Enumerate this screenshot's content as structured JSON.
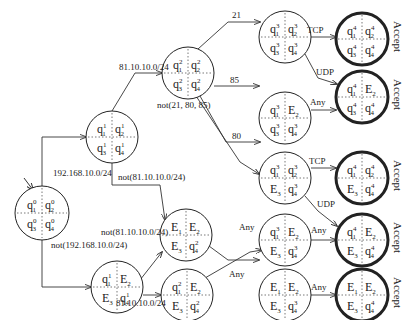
{
  "diagram": {
    "type": "state-machine",
    "nodes": [
      {
        "id": "S0",
        "x": 42,
        "y": 213,
        "r": 27,
        "cells": [
          [
            "q",
            "1",
            "0"
          ],
          [
            "q",
            "2",
            "0"
          ],
          [
            "q",
            "3",
            "0"
          ],
          [
            "q",
            "4",
            "0"
          ]
        ],
        "start": true,
        "accept": false
      },
      {
        "id": "A",
        "x": 112,
        "y": 137,
        "r": 26,
        "cells": [
          [
            "q",
            "1",
            "1"
          ],
          [
            "q",
            "2",
            "1"
          ],
          [
            "q",
            "3",
            "1"
          ],
          [
            "q",
            "4",
            "1"
          ]
        ],
        "accept": false
      },
      {
        "id": "B",
        "x": 117,
        "y": 287,
        "r": 26,
        "cells": [
          [
            "q",
            "1",
            "1"
          ],
          [
            "E",
            "2",
            ""
          ],
          [
            "E",
            "3",
            ""
          ],
          [
            "q",
            "4",
            "1"
          ]
        ],
        "accept": false
      },
      {
        "id": "C",
        "x": 188,
        "y": 73,
        "r": 26,
        "cells": [
          [
            "q",
            "1",
            "2"
          ],
          [
            "q",
            "2",
            "2"
          ],
          [
            "q",
            "3",
            "2"
          ],
          [
            "q",
            "4",
            "2"
          ]
        ],
        "accept": false
      },
      {
        "id": "D",
        "x": 186,
        "y": 235,
        "r": 26,
        "cells": [
          [
            "E",
            "1",
            ""
          ],
          [
            "E",
            "2",
            ""
          ],
          [
            "E",
            "3",
            ""
          ],
          [
            "q",
            "4",
            "2"
          ]
        ],
        "accept": false
      },
      {
        "id": "E",
        "x": 187,
        "y": 295,
        "r": 26,
        "cells": [
          [
            "q",
            "1",
            "2"
          ],
          [
            "E",
            "2",
            ""
          ],
          [
            "E",
            "3",
            ""
          ],
          [
            "q",
            "4",
            "2"
          ]
        ],
        "accept": false
      },
      {
        "id": "F",
        "x": 285,
        "y": 37,
        "r": 26,
        "cells": [
          [
            "q",
            "1",
            "3"
          ],
          [
            "q",
            "2",
            "3"
          ],
          [
            "q",
            "3",
            "3"
          ],
          [
            "q",
            "4",
            "3"
          ]
        ],
        "accept": false
      },
      {
        "id": "G",
        "x": 285,
        "y": 118,
        "r": 26,
        "cells": [
          [
            "q",
            "1",
            "3"
          ],
          [
            "E",
            "2",
            ""
          ],
          [
            "q",
            "3",
            "3"
          ],
          [
            "q",
            "4",
            "3"
          ]
        ],
        "accept": false
      },
      {
        "id": "H",
        "x": 285,
        "y": 178,
        "r": 26,
        "cells": [
          [
            "q",
            "1",
            "3"
          ],
          [
            "q",
            "2",
            "3"
          ],
          [
            "E",
            "3",
            ""
          ],
          [
            "q",
            "4",
            "3"
          ]
        ],
        "accept": false
      },
      {
        "id": "I",
        "x": 285,
        "y": 240,
        "r": 26,
        "cells": [
          [
            "q",
            "1",
            "3"
          ],
          [
            "E",
            "2",
            ""
          ],
          [
            "E",
            "3",
            ""
          ],
          [
            "q",
            "4",
            "3"
          ]
        ],
        "accept": false
      },
      {
        "id": "J",
        "x": 285,
        "y": 295,
        "r": 26,
        "cells": [
          [
            "E",
            "1",
            ""
          ],
          [
            "E",
            "2",
            ""
          ],
          [
            "E",
            "3",
            ""
          ],
          [
            "q",
            "4",
            "3"
          ]
        ],
        "accept": false
      },
      {
        "id": "K",
        "x": 362,
        "y": 39,
        "r": 26,
        "cells": [
          [
            "q",
            "1",
            "4"
          ],
          [
            "q",
            "2",
            "4"
          ],
          [
            "q",
            "3",
            "4"
          ],
          [
            "q",
            "4",
            "4"
          ]
        ],
        "accept": true
      },
      {
        "id": "L",
        "x": 362,
        "y": 97,
        "r": 26,
        "cells": [
          [
            "q",
            "1",
            "4"
          ],
          [
            "E",
            "2",
            ""
          ],
          [
            "q",
            "3",
            "4"
          ],
          [
            "q",
            "4",
            "4"
          ]
        ],
        "accept": true
      },
      {
        "id": "M",
        "x": 362,
        "y": 178,
        "r": 26,
        "cells": [
          [
            "q",
            "1",
            "4"
          ],
          [
            "q",
            "2",
            "4"
          ],
          [
            "E",
            "3",
            ""
          ],
          [
            "q",
            "4",
            "4"
          ]
        ],
        "accept": true
      },
      {
        "id": "N",
        "x": 362,
        "y": 240,
        "r": 26,
        "cells": [
          [
            "q",
            "1",
            "4"
          ],
          [
            "E",
            "2",
            ""
          ],
          [
            "E",
            "3",
            ""
          ],
          [
            "q",
            "4",
            "4"
          ]
        ],
        "accept": true
      },
      {
        "id": "O",
        "x": 362,
        "y": 295,
        "r": 26,
        "cells": [
          [
            "E",
            "1",
            ""
          ],
          [
            "E",
            "2",
            ""
          ],
          [
            "E",
            "3",
            ""
          ],
          [
            "q",
            "4",
            "4"
          ]
        ],
        "accept": true
      }
    ],
    "edges": [
      {
        "path": "M 30 185 L 30 185",
        "label": "",
        "lx": 0,
        "ly": 0
      },
      {
        "path": "M 42 186 L 42 137 L 86 137",
        "label": "192.168.10.0/24",
        "lx": 53,
        "ly": 176
      },
      {
        "path": "M 42 240 L 42 287 L 91 287",
        "label": "not(192.168.10.0/24)",
        "lx": 51,
        "ly": 248
      },
      {
        "path": "M 112 111 L 135 73 L 162 73",
        "label": "81.10.10.0/24",
        "lx": 119,
        "ly": 70
      },
      {
        "path": "M 112 163 L 112 185 L 160 185 L 165 220",
        "label": "not(81.10.10.0/24)",
        "lx": 118,
        "ly": 180
      },
      {
        "path": "M 140 280 L 162 252",
        "label": "not(81.10.10.0/24)",
        "lx": 101,
        "ly": 235
      },
      {
        "path": "M 143 295 L 161 295",
        "label": "81.10.10.0/24",
        "lx": 116,
        "ly": 306
      },
      {
        "path": "M 198 49 L 228 22 L 260 22",
        "label": "21",
        "lx": 232,
        "ly": 18
      },
      {
        "path": "M 214 86 L 259 86",
        "label": "85",
        "lx": 230,
        "ly": 83
      },
      {
        "path": "M 200 96 L 226 142 L 260 142",
        "label": "80",
        "lx": 232,
        "ly": 139
      },
      {
        "path": "M 196 96 L 240 162 L 259 174",
        "label": "not(21, 80, 85)",
        "lx": 157,
        "ly": 108
      },
      {
        "path": "M 209 246 L 228 260 L 259 260",
        "label": "Any",
        "lx": 229,
        "ly": 277
      },
      {
        "path": "M 205 278 L 250 252 L 262 250",
        "label": "Any",
        "lx": 239,
        "ly": 230
      },
      {
        "path": "M 311 37 L 336 37",
        "label": "TCP",
        "lx": 307,
        "ly": 33
      },
      {
        "path": "M 305 54 L 318 78 L 337 84",
        "label": "UDP",
        "lx": 316,
        "ly": 75
      },
      {
        "path": "M 311 110 L 336 110",
        "label": "Any",
        "lx": 310,
        "ly": 105
      },
      {
        "path": "M 311 168 L 336 168",
        "label": "TCP",
        "lx": 309,
        "ly": 164
      },
      {
        "path": "M 305 196 L 318 211 L 337 226",
        "label": "UDP",
        "lx": 317,
        "ly": 207
      },
      {
        "path": "M 311 240 L 336 240",
        "label": "Any",
        "lx": 311,
        "ly": 233
      },
      {
        "path": "M 311 295 L 336 295",
        "label": "Any",
        "lx": 311,
        "ly": 290
      }
    ],
    "accept_label": "Accept"
  }
}
